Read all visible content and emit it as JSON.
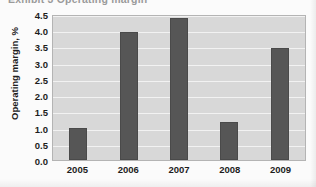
{
  "chart_data": {
    "type": "bar",
    "title": "Exhibit 3  Operating margin",
    "xlabel": "",
    "ylabel": "Operating margin, %",
    "categories": [
      "2005",
      "2006",
      "2007",
      "2008",
      "2009"
    ],
    "values": [
      1.0,
      3.95,
      4.38,
      1.18,
      3.45
    ],
    "ylim": [
      0.0,
      4.5
    ],
    "ytick_labels": [
      "0.0",
      "0.5",
      "1.0",
      "1.5",
      "2.0",
      "2.5",
      "3.0",
      "3.5",
      "4.0",
      "4.5"
    ],
    "ytick_values": [
      0.0,
      0.5,
      1.0,
      1.5,
      2.0,
      2.5,
      3.0,
      3.5,
      4.0,
      4.5
    ],
    "grid": true,
    "legend": false,
    "series_color": "#565656",
    "plot_background": "#d8d8d8",
    "gridline_color": "#f2f2f2"
  }
}
